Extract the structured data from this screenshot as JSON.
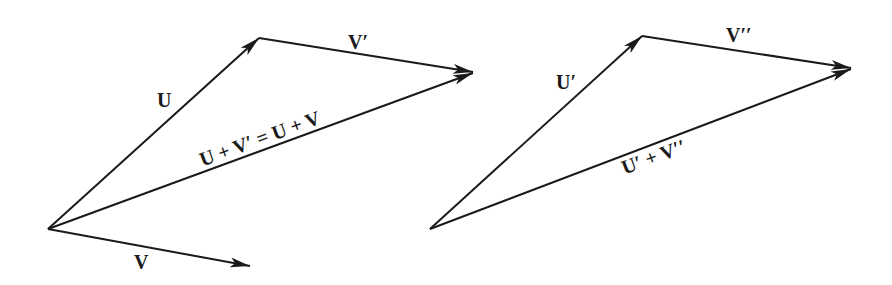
{
  "diagram": {
    "left": {
      "labels": {
        "U": "U",
        "V": "V",
        "V_prime": "V′",
        "sum": "U + V′ = U + V"
      }
    },
    "right": {
      "labels": {
        "U_prime": "U′",
        "V_double_prime": "V′′",
        "sum": "U′ + V′′"
      }
    },
    "colors": {
      "stroke": "#1a1a1a",
      "background": "#ffffff"
    }
  }
}
